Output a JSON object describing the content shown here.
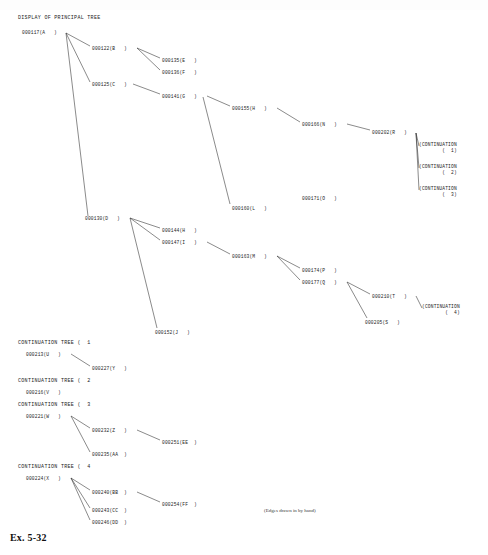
{
  "figure": {
    "label": "Ex. 5-32",
    "handnote": "(Edges drawn in by hand)"
  },
  "principal_tree": {
    "title": "DISPLAY OF PRINCIPAL TREE",
    "nodes": [
      {
        "id": "n-000117",
        "label": "000117(A   )",
        "x": 22,
        "y": 30
      },
      {
        "id": "n-000122",
        "label": "000122(B   )",
        "x": 92,
        "y": 46
      },
      {
        "id": "n-000135",
        "label": "000135(E   )",
        "x": 162,
        "y": 58
      },
      {
        "id": "n-000136",
        "label": "000136(F   )",
        "x": 162,
        "y": 70
      },
      {
        "id": "n-000125",
        "label": "000125(C   )",
        "x": 92,
        "y": 82
      },
      {
        "id": "n-000141",
        "label": "000141(G   )",
        "x": 162,
        "y": 94
      },
      {
        "id": "n-000155",
        "label": "000155(H   )",
        "x": 232,
        "y": 106
      },
      {
        "id": "n-000166",
        "label": "000166(N   )",
        "x": 302,
        "y": 122
      },
      {
        "id": "n-000202",
        "label": "000202(R   )",
        "x": 372,
        "y": 130
      },
      {
        "id": "n-000160",
        "label": "000160(L   )",
        "x": 232,
        "y": 206
      },
      {
        "id": "n-000171",
        "label": "000171(O   )",
        "x": 302,
        "y": 196
      },
      {
        "id": "n-000130",
        "label": "000130(D   )",
        "x": 85,
        "y": 216
      },
      {
        "id": "n-000144",
        "label": "000144(H   )",
        "x": 162,
        "y": 228
      },
      {
        "id": "n-000147",
        "label": "000147(I   )",
        "x": 162,
        "y": 240
      },
      {
        "id": "n-000163",
        "label": "000163(M   )",
        "x": 232,
        "y": 254
      },
      {
        "id": "n-000174",
        "label": "000174(P   )",
        "x": 302,
        "y": 268
      },
      {
        "id": "n-000177",
        "label": "000177(Q   )",
        "x": 302,
        "y": 280
      },
      {
        "id": "n-000210",
        "label": "000210(T   )",
        "x": 372,
        "y": 294
      },
      {
        "id": "n-000205",
        "label": "000205(S   )",
        "x": 365,
        "y": 320
      },
      {
        "id": "n-000152",
        "label": "000152(J   )",
        "x": 155,
        "y": 330
      }
    ],
    "continuation_markers": [
      {
        "id": "cm-1",
        "line1": "(CONTINUATION",
        "line2": "(  1)",
        "x": 419,
        "y": 142
      },
      {
        "id": "cm-2",
        "line1": "(CONTINUATION",
        "line2": "(  2)",
        "x": 419,
        "y": 164
      },
      {
        "id": "cm-3",
        "line1": "(CONTINUATION",
        "line2": "(  3)",
        "x": 419,
        "y": 186
      },
      {
        "id": "cm-4",
        "line1": "(CONTINUATION",
        "line2": "(  4)",
        "x": 422,
        "y": 304
      }
    ]
  },
  "continuation_trees": [
    {
      "id": "ct-1",
      "title": "CONTINUATION TREE (  1",
      "title_x": 18,
      "title_y": 340,
      "nodes": [
        {
          "id": "n-000213",
          "label": "000213(U   )",
          "x": 26,
          "y": 352
        },
        {
          "id": "n-000227",
          "label": "000227(Y   )",
          "x": 92,
          "y": 366
        }
      ]
    },
    {
      "id": "ct-2",
      "title": "CONTINUATION TREE (  2",
      "title_x": 18,
      "title_y": 378,
      "nodes": [
        {
          "id": "n-000216",
          "label": "000216(V   )",
          "x": 26,
          "y": 390
        }
      ]
    },
    {
      "id": "ct-3",
      "title": "CONTINUATION TREE (  3",
      "title_x": 18,
      "title_y": 402,
      "nodes": [
        {
          "id": "n-000221",
          "label": "000221(W   )",
          "x": 26,
          "y": 414
        },
        {
          "id": "n-000232",
          "label": "000232(Z   )",
          "x": 92,
          "y": 428
        },
        {
          "id": "n-000251",
          "label": "000251(EE  )",
          "x": 162,
          "y": 440
        },
        {
          "id": "n-000235",
          "label": "000235(AA  )",
          "x": 92,
          "y": 452
        }
      ]
    },
    {
      "id": "ct-4",
      "title": "CONTINUATION TREE (  4",
      "title_x": 18,
      "title_y": 464,
      "nodes": [
        {
          "id": "n-000224",
          "label": "000224(X   )",
          "x": 26,
          "y": 476
        },
        {
          "id": "n-000240",
          "label": "000240(BB  )",
          "x": 92,
          "y": 490
        },
        {
          "id": "n-000254",
          "label": "000254(FF  )",
          "x": 162,
          "y": 502
        },
        {
          "id": "n-000243",
          "label": "000243(CC  )",
          "x": 92,
          "y": 508
        },
        {
          "id": "n-000246",
          "label": "000246(DD  )",
          "x": 92,
          "y": 520
        }
      ]
    }
  ],
  "edges": [
    {
      "x1": 66,
      "y1": 33,
      "x2": 90,
      "y2": 46
    },
    {
      "x1": 66,
      "y1": 33,
      "x2": 90,
      "y2": 82
    },
    {
      "x1": 66,
      "y1": 33,
      "x2": 88,
      "y2": 216
    },
    {
      "x1": 137,
      "y1": 48,
      "x2": 160,
      "y2": 58
    },
    {
      "x1": 137,
      "y1": 48,
      "x2": 160,
      "y2": 70
    },
    {
      "x1": 133,
      "y1": 84,
      "x2": 160,
      "y2": 94
    },
    {
      "x1": 207,
      "y1": 96,
      "x2": 230,
      "y2": 106
    },
    {
      "x1": 203,
      "y1": 97,
      "x2": 230,
      "y2": 204
    },
    {
      "x1": 277,
      "y1": 108,
      "x2": 300,
      "y2": 122
    },
    {
      "x1": 347,
      "y1": 124,
      "x2": 370,
      "y2": 130
    },
    {
      "x1": 416,
      "y1": 133,
      "x2": 419,
      "y2": 146
    },
    {
      "x1": 416,
      "y1": 133,
      "x2": 419,
      "y2": 168
    },
    {
      "x1": 416,
      "y1": 133,
      "x2": 419,
      "y2": 190
    },
    {
      "x1": 130,
      "y1": 218,
      "x2": 160,
      "y2": 228
    },
    {
      "x1": 130,
      "y1": 218,
      "x2": 160,
      "y2": 240
    },
    {
      "x1": 130,
      "y1": 218,
      "x2": 157,
      "y2": 328
    },
    {
      "x1": 207,
      "y1": 242,
      "x2": 230,
      "y2": 254
    },
    {
      "x1": 277,
      "y1": 256,
      "x2": 300,
      "y2": 268
    },
    {
      "x1": 277,
      "y1": 256,
      "x2": 300,
      "y2": 280
    },
    {
      "x1": 347,
      "y1": 282,
      "x2": 370,
      "y2": 294
    },
    {
      "x1": 347,
      "y1": 282,
      "x2": 367,
      "y2": 318
    },
    {
      "x1": 416,
      "y1": 296,
      "x2": 422,
      "y2": 308
    },
    {
      "x1": 71,
      "y1": 354,
      "x2": 90,
      "y2": 366
    },
    {
      "x1": 71,
      "y1": 416,
      "x2": 90,
      "y2": 428
    },
    {
      "x1": 71,
      "y1": 416,
      "x2": 90,
      "y2": 452
    },
    {
      "x1": 137,
      "y1": 430,
      "x2": 160,
      "y2": 440
    },
    {
      "x1": 71,
      "y1": 478,
      "x2": 90,
      "y2": 490
    },
    {
      "x1": 71,
      "y1": 478,
      "x2": 90,
      "y2": 508
    },
    {
      "x1": 71,
      "y1": 478,
      "x2": 90,
      "y2": 520
    },
    {
      "x1": 137,
      "y1": 492,
      "x2": 160,
      "y2": 502
    }
  ]
}
